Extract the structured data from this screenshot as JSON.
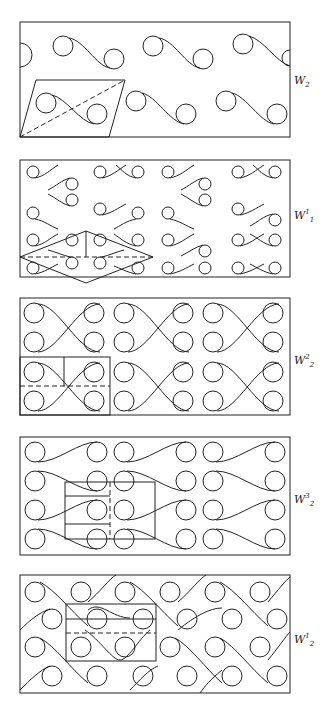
{
  "figure": {
    "panels": [
      {
        "id": "W2",
        "label": "W",
        "sup": "",
        "sub": "2",
        "label_y": 74,
        "frame": [
          20,
          22,
          270,
          115
        ],
        "cell": "parallelogram with dashed diagonal"
      },
      {
        "id": "W1_1",
        "label": "W",
        "sup": "1",
        "sub": "1",
        "label_y": 210,
        "frame": [
          20,
          160,
          270,
          117
        ],
        "cell": "rhombus with vertical line and dashed horizontal axis"
      },
      {
        "id": "W2_2",
        "label": "W",
        "sup": "2",
        "sub": "2",
        "label_y": 355,
        "frame": [
          20,
          298,
          270,
          117
        ],
        "cell": "rectangle split by vertical line and dashed horizontal line"
      },
      {
        "id": "W2_3",
        "label": "W",
        "sup": "3",
        "sub": "2",
        "label_y": 494,
        "frame": [
          20,
          437,
          270,
          118
        ],
        "cell": "rectangle with two horizontal lines and dashed vertical line"
      },
      {
        "id": "W2_1",
        "label": "W",
        "sup": "1",
        "sub": "2",
        "label_y": 634,
        "frame": [
          20,
          575,
          270,
          118
        ],
        "cell": "rectangle with horizontal line and dashed horizontal line"
      }
    ],
    "colors": {
      "stroke": "#222222",
      "background": "#ffffff"
    }
  }
}
